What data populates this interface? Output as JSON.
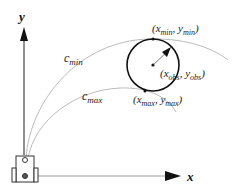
{
  "diagram": {
    "axes": {
      "x_label": "x",
      "y_label": "y"
    },
    "curves": [
      {
        "name": "c_min",
        "label_main": "c",
        "label_sub": "min"
      },
      {
        "name": "c_max",
        "label_main": "c",
        "label_sub": "max"
      }
    ],
    "points": {
      "min_point": {
        "open": "(",
        "x": "x",
        "x_sub": "min",
        "sep": ", ",
        "y": "y",
        "y_sub": "min",
        "close": ")"
      },
      "obs_point": {
        "open": "(",
        "x": "x",
        "x_sub": "obs",
        "sep": ", ",
        "y": "y",
        "y_sub": "obs",
        "close": ")"
      },
      "max_point": {
        "open": "(",
        "x": "x",
        "x_sub": "max",
        "sep": ", ",
        "y": "y",
        "y_sub": "max",
        "close": ")"
      }
    },
    "colors": {
      "axis": "#111111",
      "curve": "#aaaaaa",
      "obstacle": "#111111",
      "robot": "#333333"
    }
  }
}
